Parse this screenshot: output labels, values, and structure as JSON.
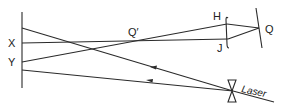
{
  "diagram": {
    "type": "optics-ray-diagram",
    "labels": {
      "x": "X",
      "y": "Y",
      "h": "H",
      "j": "J",
      "q": "Q",
      "q_prime": "Q′",
      "laser": "Laser"
    },
    "colors": {
      "line": "#2a2a2a",
      "background": "#ffffff"
    },
    "elements": [
      "screen (left vertical line)",
      "diverging lens at laser",
      "lens/aperture at H-J",
      "mirror at Q",
      "rays with direction arrows"
    ]
  }
}
